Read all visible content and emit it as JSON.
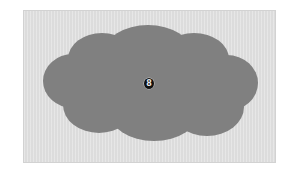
{
  "figure": {
    "kind": "cloud-diagram",
    "canvas": {
      "width": 297,
      "height": 179,
      "background_color": "#ffffff"
    },
    "panel": {
      "label": "",
      "background_color": "#dcdcdc",
      "border_color": "#d2d2d2",
      "x": 23,
      "y": 10,
      "width": 253,
      "height": 153
    },
    "cloud": {
      "label": "",
      "fill_color": "#808080",
      "bounds": {
        "x": 42,
        "y": 37,
        "width": 214,
        "height": 104
      },
      "lobe_count": 7
    },
    "center_marker": {
      "glyph": "8",
      "circled_glyph": "⑧",
      "shape": "circled-numeral",
      "fill_color": "#111111",
      "text_color": "#e8e8e8",
      "x": 148,
      "y": 82
    }
  }
}
